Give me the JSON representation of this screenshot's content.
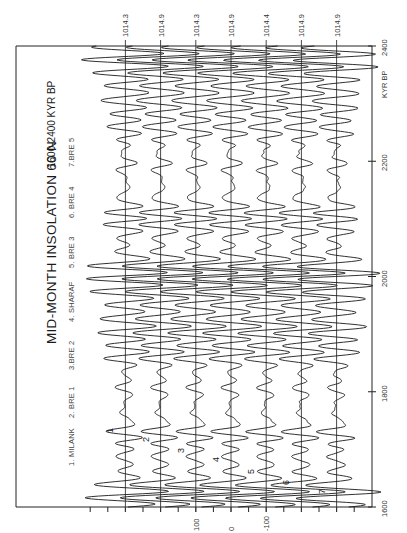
{
  "chart_data": {
    "type": "line",
    "orientation": "rotated-90-ccw",
    "title": "MID-MONTH  INSOLATION  60 N",
    "subtitle": "1600-2400 KYR BP",
    "xlabel": "KYR BP",
    "ylabel": "",
    "xlim": [
      1600,
      2400
    ],
    "x_ticks": [
      1600,
      1800,
      2000,
      2200,
      2400
    ],
    "y_ticks": [
      100,
      0,
      -100
    ],
    "y_tick_labels": [
      "100",
      "0",
      "-100"
    ],
    "y_minor_tick_step": 50,
    "grid": false,
    "legend": [
      "1. MILANK",
      "2. BRE 1",
      "3.BRE 2",
      "4. SHARAF",
      "5. BRE 3",
      "6. BRE 4",
      "7.BRE 5"
    ],
    "series": [
      {
        "name": "1. MILANK",
        "label": "1",
        "baseline": 1014.3,
        "baseline_label": "1014.3",
        "offset": 300,
        "phase": 0.0,
        "jitter": 0.0
      },
      {
        "name": "2. BRE 1",
        "label": "2",
        "baseline": 1014.9,
        "baseline_label": "1014.9",
        "offset": 200,
        "phase": 0.06,
        "jitter": 0.05
      },
      {
        "name": "3.BRE 2",
        "label": "3",
        "baseline": 1014.3,
        "baseline_label": "1014.3",
        "offset": 100,
        "phase": 0.1,
        "jitter": 0.08
      },
      {
        "name": "4. SHARAF",
        "label": "4",
        "baseline": 1014.9,
        "baseline_label": "1014.9",
        "offset": 0,
        "phase": 0.16,
        "jitter": 0.1
      },
      {
        "name": "5. BRE 3",
        "label": "5",
        "baseline": 1014.4,
        "baseline_label": "1014.4",
        "offset": -100,
        "phase": 0.22,
        "jitter": 0.12
      },
      {
        "name": "6. BRE 4",
        "label": "6",
        "baseline": 1014.9,
        "baseline_label": "1014.9",
        "offset": -200,
        "phase": 0.28,
        "jitter": 0.14
      },
      {
        "name": "7.BRE 5",
        "label": "7",
        "baseline": 1014.9,
        "baseline_label": "1014.9",
        "offset": -300,
        "phase": 0.34,
        "jitter": 0.16
      }
    ],
    "signal_model": {
      "description": "Insolation anomaly (W/m2) about each baseline; quasi-periodic precession modulated by eccentricity",
      "precession_periods_kyr": [
        23.7,
        22.4,
        19.0
      ],
      "precession_weights": [
        0.55,
        0.3,
        0.2
      ],
      "obliquity_period_kyr": 41.0,
      "obliquity_weight": 0.18,
      "eccentricity_periods_kyr": [
        95.0,
        124.0,
        404.0
      ],
      "base_amplitude": 70,
      "eccentricity_amplitudes": [
        28,
        18,
        22
      ],
      "sample_step_kyr": 1
    },
    "series_label_positions_kyr": [
      1735,
      1720,
      1700,
      1685,
      1665,
      1645,
      1630
    ]
  },
  "layout": {
    "plot_left_px": 16,
    "plot_right_px": 372,
    "plot_top_px": 46,
    "plot_bottom_px": 507,
    "px_per_unit_y": 0.352,
    "zero_x_px": 231
  }
}
